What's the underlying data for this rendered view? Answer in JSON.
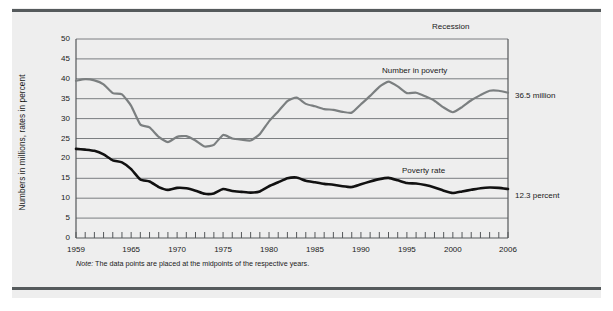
{
  "figure": {
    "note": "Note:",
    "note_text": " The data points are placed at the midpoints of the respective years.",
    "recession_label": "Recession",
    "background_color": "#eeeeee",
    "rule_color": "#555a5c"
  },
  "annotations": {
    "number_in_poverty_label": "Number in poverty",
    "poverty_rate_label": "Poverty rate",
    "number_in_poverty_callout": "36.5 million",
    "poverty_rate_callout": "12.3 percent"
  },
  "chart_data": {
    "type": "line",
    "title": "",
    "subtitle": "",
    "xlabel": "",
    "ylabel": "Numbers in millions, rates in percent",
    "xlim": [
      1959,
      2006
    ],
    "ylim": [
      0,
      50
    ],
    "grid": true,
    "grid_axis": "y",
    "legend_position": "inline-annotation",
    "ytick_labels": [
      "0",
      "5",
      "10",
      "15",
      "20",
      "25",
      "30",
      "35",
      "40",
      "45",
      "50"
    ],
    "yticks": [
      0,
      5,
      10,
      15,
      20,
      25,
      30,
      35,
      40,
      45,
      50
    ],
    "xtick_labels": [
      "1959",
      "1965",
      "1970",
      "1975",
      "1980",
      "1985",
      "1990",
      "1995",
      "2000",
      "2006"
    ],
    "xticks": [
      1959,
      1965,
      1970,
      1975,
      1980,
      1985,
      1990,
      1995,
      2000,
      2006
    ],
    "minor_xticks_every": 1,
    "x": [
      1959,
      1960,
      1961,
      1962,
      1963,
      1964,
      1965,
      1966,
      1967,
      1968,
      1969,
      1970,
      1971,
      1972,
      1973,
      1974,
      1975,
      1976,
      1977,
      1978,
      1979,
      1980,
      1981,
      1982,
      1983,
      1984,
      1985,
      1986,
      1987,
      1988,
      1989,
      1990,
      1991,
      1992,
      1993,
      1994,
      1995,
      1996,
      1997,
      1998,
      1999,
      2000,
      2001,
      2002,
      2003,
      2004,
      2005,
      2006
    ],
    "series": [
      {
        "name": "Number in poverty",
        "unit": "millions",
        "color": "#7b7f80",
        "width": 2.2,
        "values": [
          39.5,
          39.9,
          39.6,
          38.6,
          36.4,
          36.1,
          33.2,
          28.5,
          27.8,
          25.4,
          24.1,
          25.4,
          25.6,
          24.5,
          23.0,
          23.4,
          25.9,
          25.0,
          24.7,
          24.5,
          26.1,
          29.3,
          31.8,
          34.4,
          35.3,
          33.7,
          33.1,
          32.4,
          32.2,
          31.7,
          31.5,
          33.6,
          35.7,
          38.0,
          39.3,
          38.1,
          36.4,
          36.5,
          35.6,
          34.5,
          32.8,
          31.6,
          32.9,
          34.6,
          35.9,
          37.0,
          37.0,
          36.5
        ]
      },
      {
        "name": "Poverty rate",
        "unit": "percent",
        "color": "#111111",
        "width": 2.6,
        "values": [
          22.4,
          22.2,
          21.9,
          21.0,
          19.5,
          19.0,
          17.3,
          14.7,
          14.2,
          12.8,
          12.1,
          12.6,
          12.5,
          11.9,
          11.1,
          11.2,
          12.3,
          11.8,
          11.6,
          11.4,
          11.7,
          13.0,
          14.0,
          15.0,
          15.2,
          14.4,
          14.0,
          13.6,
          13.4,
          13.0,
          12.8,
          13.5,
          14.2,
          14.8,
          15.1,
          14.5,
          13.8,
          13.7,
          13.3,
          12.7,
          11.9,
          11.3,
          11.7,
          12.1,
          12.5,
          12.7,
          12.6,
          12.3
        ]
      }
    ]
  }
}
